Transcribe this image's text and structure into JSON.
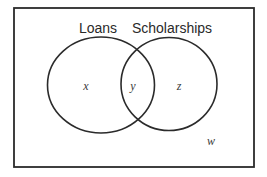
{
  "diagram": {
    "type": "venn",
    "universe": {
      "label": "w",
      "x": 14,
      "y": 8,
      "width": 240,
      "height": 159
    },
    "sets": [
      {
        "name": "Loans",
        "label": "Loans",
        "cx": 101,
        "cy": 85,
        "rx": 53.5,
        "ry": 48,
        "label_x": 98,
        "label_y": 33
      },
      {
        "name": "Scholarships",
        "label": "Scholarships",
        "cx": 169,
        "cy": 84,
        "rx": 48,
        "ry": 46.5,
        "label_x": 172,
        "label_y": 33
      }
    ],
    "regions": {
      "loans_only": {
        "label": "x",
        "x": 86,
        "y": 90
      },
      "both": {
        "label": "y",
        "x": 133,
        "y": 90
      },
      "scholarships_only": {
        "label": "z",
        "x": 179,
        "y": 90
      },
      "neither": {
        "label": "w",
        "x": 211,
        "y": 145
      }
    },
    "colors": {
      "stroke": "#2b2b2b",
      "text": "#2a2a2a",
      "background": "#ffffff"
    }
  }
}
